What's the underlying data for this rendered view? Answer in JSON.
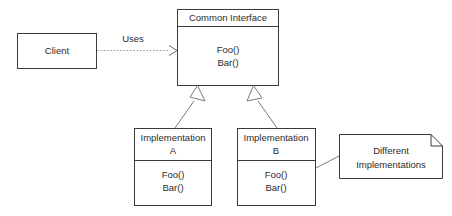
{
  "diagram": {
    "type": "uml-class-diagram",
    "background_color": "#ffffff",
    "line_color": "#3a3a3a",
    "connector_color": "#7a7a7a",
    "text_color": "#2b2b2b"
  },
  "classes": {
    "client": {
      "name": "Client",
      "has_compartments": false
    },
    "common_interface": {
      "name": "Common Interface",
      "operations": [
        "Foo()",
        "Bar()"
      ],
      "operation_1": "Foo()",
      "operation_2": "Bar()"
    },
    "implementation_a": {
      "name_line_1": "Implementation",
      "name_line_2": "A",
      "operations": [
        "Foo()",
        "Bar()"
      ],
      "operation_1": "Foo()",
      "operation_2": "Bar()"
    },
    "implementation_b": {
      "name_line_1": "Implementation",
      "name_line_2": "B",
      "operations": [
        "Foo()",
        "Bar()"
      ],
      "operation_1": "Foo()",
      "operation_2": "Bar()"
    }
  },
  "note": {
    "line_1": "Different",
    "line_2": "Implementations"
  },
  "relationships": {
    "dependency": {
      "label": "Uses",
      "from": "Client",
      "to": "Common Interface",
      "style": "dashed-open-arrow"
    },
    "generalization_a": {
      "from": "Implementation A",
      "to": "Common Interface",
      "style": "hollow-triangle"
    },
    "generalization_b": {
      "from": "Implementation B",
      "to": "Common Interface",
      "style": "hollow-triangle"
    },
    "note_anchor": {
      "from": "Note",
      "to": "Implementation B",
      "style": "solid-line"
    }
  }
}
